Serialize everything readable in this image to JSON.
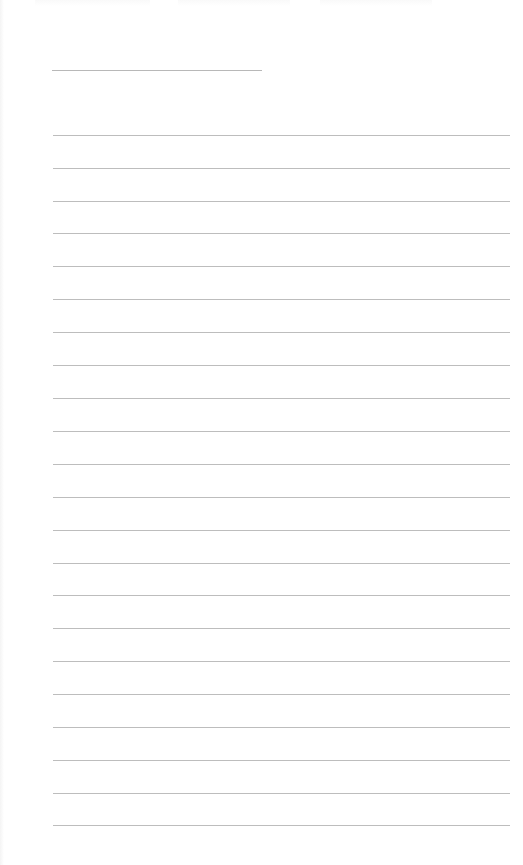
{
  "document": {
    "type": "lined-form-page",
    "header_text": "",
    "name_line": {
      "label": "",
      "value": ""
    },
    "lines": [
      {
        "y": 135,
        "text": ""
      },
      {
        "y": 168,
        "text": ""
      },
      {
        "y": 201,
        "text": ""
      },
      {
        "y": 233,
        "text": ""
      },
      {
        "y": 266,
        "text": ""
      },
      {
        "y": 299,
        "text": ""
      },
      {
        "y": 332,
        "text": ""
      },
      {
        "y": 365,
        "text": ""
      },
      {
        "y": 398,
        "text": ""
      },
      {
        "y": 431,
        "text": ""
      },
      {
        "y": 464,
        "text": ""
      },
      {
        "y": 497,
        "text": ""
      },
      {
        "y": 530,
        "text": ""
      },
      {
        "y": 563,
        "text": ""
      },
      {
        "y": 595,
        "text": ""
      },
      {
        "y": 628,
        "text": ""
      },
      {
        "y": 661,
        "text": ""
      },
      {
        "y": 694,
        "text": ""
      },
      {
        "y": 727,
        "text": ""
      },
      {
        "y": 760,
        "text": ""
      },
      {
        "y": 793,
        "text": ""
      },
      {
        "y": 825,
        "text": ""
      }
    ],
    "colors": {
      "background": "#ffffff",
      "rule": "#bdbdbd"
    }
  }
}
